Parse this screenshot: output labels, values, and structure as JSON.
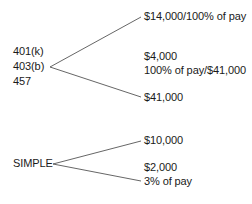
{
  "diagram": {
    "groups": [
      {
        "source_labels": [
          "401(k)",
          "403(b)",
          "457"
        ],
        "branches": [
          {
            "label": "$14,000/100% of pay"
          },
          {
            "label": "$4,000"
          },
          {
            "label": "100% of pay/$41,000"
          },
          {
            "label": "$41,000"
          }
        ]
      },
      {
        "source_labels": [
          "SIMPLE"
        ],
        "branches": [
          {
            "label": "$10,000"
          },
          {
            "label": "$2,000"
          },
          {
            "label": "3% of pay"
          }
        ]
      }
    ],
    "line_color": "#555555"
  }
}
